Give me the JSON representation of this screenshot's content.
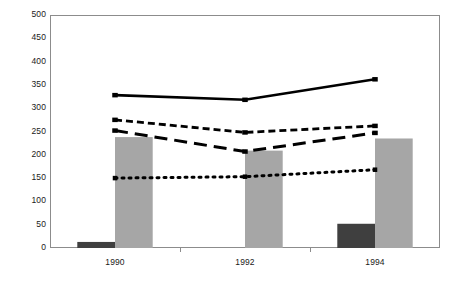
{
  "chart_data": {
    "type": "bar",
    "title": "Latvia",
    "xlabel": "",
    "ylabel": "",
    "categories": [
      "1990",
      "1992",
      "1994"
    ],
    "ylim": [
      0,
      500
    ],
    "ytick_step": 50,
    "yticks": [
      "500",
      "450",
      "400",
      "350",
      "300",
      "250",
      "200",
      "150",
      "100",
      "50",
      "0"
    ],
    "grid": false,
    "legend": "none",
    "series": [
      {
        "name": "dark-bar-series",
        "render": "bar",
        "style": "solid-fill",
        "color": "#3f3f3f",
        "values": [
          13,
          0,
          52
        ]
      },
      {
        "name": "gray-bar-series",
        "render": "bar",
        "style": "solid-fill",
        "color": "#a6a6a6",
        "values": [
          238,
          209,
          235
        ]
      },
      {
        "name": "solid-line-series",
        "render": "line",
        "style": "solid",
        "color": "#000000",
        "values": [
          328,
          318,
          362
        ]
      },
      {
        "name": "short-dash-line-series",
        "render": "line",
        "style": "short-dash",
        "color": "#000000",
        "values": [
          275,
          248,
          262
        ]
      },
      {
        "name": "long-dash-line-series",
        "render": "line",
        "style": "long-dash",
        "color": "#000000",
        "values": [
          252,
          207,
          247
        ]
      },
      {
        "name": "dotted-line-series",
        "render": "line",
        "style": "dotted",
        "color": "#000000",
        "values": [
          150,
          153,
          168
        ]
      }
    ]
  },
  "axis": {
    "y_labels": [
      "500",
      "450",
      "400",
      "350",
      "300",
      "250",
      "200",
      "150",
      "100",
      "50",
      "0"
    ],
    "x_labels": [
      "1990",
      "1992",
      "1994"
    ]
  },
  "colors": {
    "frame": "#8c8c8c",
    "dark_bar": "#3f3f3f",
    "gray_bar": "#a6a6a6",
    "line": "#000000",
    "background": "#ffffff",
    "text": "#1a1a1a"
  }
}
